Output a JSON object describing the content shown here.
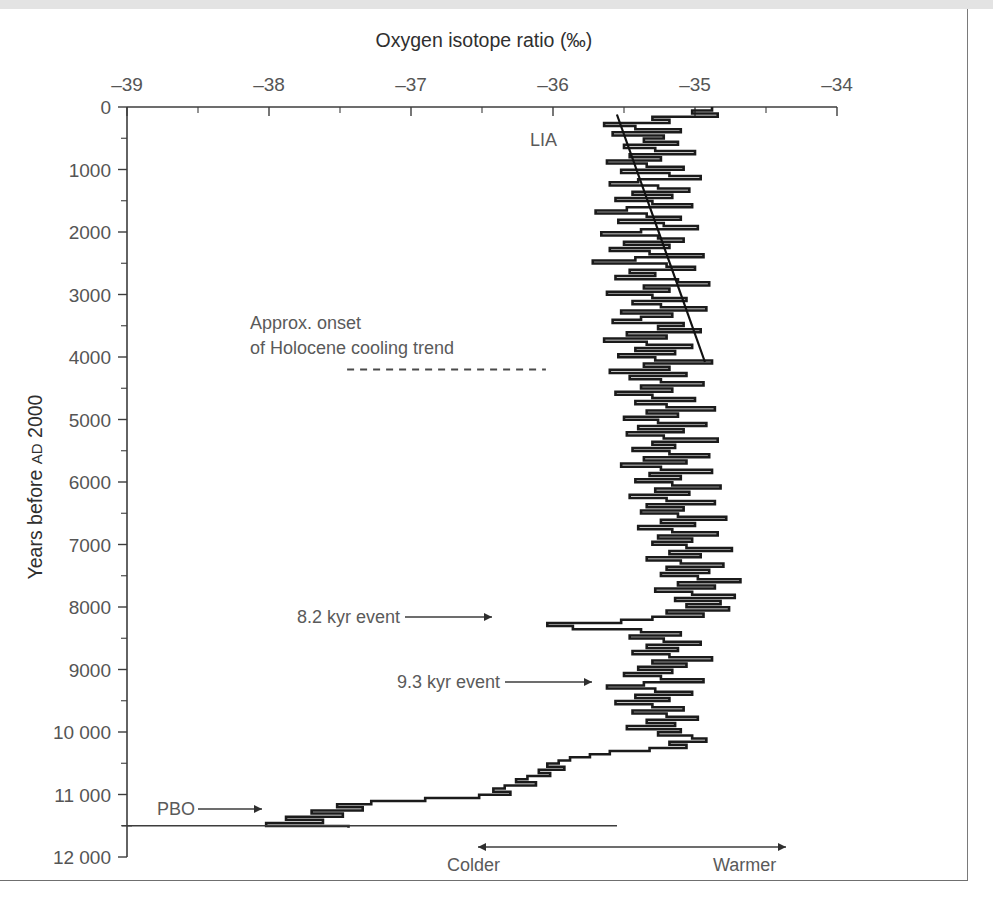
{
  "figure": {
    "top_title": "Oxygen isotope ratio (‰)",
    "y_axis_label_main": "Years before ",
    "y_axis_label_smallcaps": "AD",
    "y_axis_label_tail": " 2000"
  },
  "annotations": [
    {
      "name": "lia",
      "text": "LIA",
      "x": 530,
      "y": 137
    },
    {
      "name": "holocene-onset-line1",
      "text": "Approx. onset",
      "x": 250,
      "y": 320
    },
    {
      "name": "holocene-onset-line2",
      "text": "of Holocene cooling trend",
      "x": 250,
      "y": 345
    },
    {
      "name": "event-8200",
      "text": "8.2 kyr event",
      "x": 297,
      "y": 614
    },
    {
      "name": "event-9300",
      "text": "9.3 kyr event",
      "x": 397,
      "y": 679
    },
    {
      "name": "pbo",
      "text": "PBO",
      "x": 157,
      "y": 806
    },
    {
      "name": "colder",
      "text": "Colder",
      "x": 447,
      "y": 862
    },
    {
      "name": "warmer",
      "text": "Warmer",
      "x": 713,
      "y": 862
    }
  ],
  "chart_data": {
    "type": "line",
    "orientation": "vertical-depth-profile",
    "title": "Oxygen isotope ratio (‰)",
    "xlabel": "Oxygen isotope ratio (‰)",
    "ylabel": "Years before AD 2000",
    "xlim": [
      -39,
      -34
    ],
    "ylim": [
      0,
      12000
    ],
    "x_ticks": [
      -39,
      -38,
      -37,
      -36,
      -35,
      -34
    ],
    "x_tick_labels": [
      "–39",
      "–38",
      "–37",
      "–36",
      "–35",
      "–34"
    ],
    "x_minor_step": 0.5,
    "y_ticks": [
      0,
      1000,
      2000,
      3000,
      4000,
      5000,
      6000,
      7000,
      8000,
      9000,
      10000,
      11000,
      12000
    ],
    "y_tick_labels": [
      "0",
      "1000",
      "2000",
      "3000",
      "4000",
      "5000",
      "6000",
      "7000",
      "8000",
      "9000",
      "10 000",
      "11 000",
      "12 000"
    ],
    "y_minor_step": 500,
    "y_inverted": true,
    "grid": false,
    "legend": null,
    "series_name": "δ18O ice-core record (step plot)",
    "step_style": "horizontal-segment-per-sample",
    "direction_scale": {
      "left": "Colder",
      "right": "Warmer"
    },
    "trend_line": {
      "name": "Holocene cooling trend (late)",
      "x_start": -35.55,
      "y_start": 120,
      "x_end": -34.93,
      "y_end": 4080
    },
    "dashed_marker": {
      "name": "Approx. onset of Holocene cooling trend",
      "age": 4200,
      "x_from": -37.45,
      "x_to": -36.05
    },
    "events": [
      {
        "name": "LIA",
        "age": 350
      },
      {
        "name": "8.2 kyr event",
        "age": 8200
      },
      {
        "name": "9.3 kyr event",
        "age": 9300
      },
      {
        "name": "PBO",
        "age": 11300
      }
    ],
    "ages": [
      30,
      80,
      130,
      180,
      230,
      280,
      330,
      380,
      430,
      480,
      530,
      580,
      630,
      680,
      730,
      780,
      830,
      880,
      930,
      980,
      1030,
      1080,
      1130,
      1180,
      1230,
      1280,
      1330,
      1380,
      1430,
      1480,
      1530,
      1580,
      1630,
      1680,
      1730,
      1780,
      1830,
      1880,
      1930,
      1980,
      2030,
      2080,
      2130,
      2180,
      2230,
      2280,
      2330,
      2380,
      2430,
      2480,
      2530,
      2580,
      2630,
      2680,
      2730,
      2780,
      2830,
      2880,
      2930,
      2980,
      3030,
      3080,
      3130,
      3180,
      3230,
      3280,
      3330,
      3380,
      3430,
      3480,
      3530,
      3580,
      3630,
      3680,
      3730,
      3780,
      3830,
      3880,
      3930,
      3980,
      4030,
      4080,
      4130,
      4180,
      4230,
      4280,
      4330,
      4380,
      4430,
      4480,
      4530,
      4580,
      4630,
      4680,
      4730,
      4780,
      4830,
      4880,
      4930,
      4980,
      5030,
      5080,
      5130,
      5180,
      5230,
      5280,
      5330,
      5380,
      5430,
      5480,
      5530,
      5580,
      5630,
      5680,
      5730,
      5780,
      5830,
      5880,
      5930,
      5980,
      6030,
      6080,
      6130,
      6180,
      6230,
      6280,
      6330,
      6380,
      6430,
      6480,
      6530,
      6580,
      6630,
      6680,
      6730,
      6780,
      6830,
      6880,
      6930,
      6980,
      7030,
      7080,
      7130,
      7180,
      7230,
      7280,
      7330,
      7380,
      7430,
      7480,
      7530,
      7580,
      7630,
      7680,
      7730,
      7780,
      7830,
      7880,
      7930,
      7980,
      8030,
      8080,
      8130,
      8180,
      8230,
      8280,
      8330,
      8380,
      8430,
      8480,
      8530,
      8580,
      8630,
      8680,
      8730,
      8780,
      8830,
      8880,
      8930,
      8980,
      9030,
      9080,
      9130,
      9180,
      9230,
      9280,
      9330,
      9380,
      9430,
      9480,
      9530,
      9580,
      9630,
      9680,
      9730,
      9780,
      9830,
      9880,
      9930,
      9980,
      10030,
      10080,
      10130,
      10180,
      10230,
      10280,
      10330,
      10380,
      10430,
      10480,
      10530,
      10580,
      10630,
      10680,
      10730,
      10780,
      10830,
      10880,
      10930,
      10980,
      11030,
      11080,
      11130,
      11180,
      11230,
      11280,
      11330,
      11380,
      11430,
      11480,
      11530
    ],
    "values": [
      -34.88,
      -35.02,
      -34.84,
      -35.3,
      -35.18,
      -35.64,
      -35.42,
      -35.1,
      -35.58,
      -35.22,
      -35.36,
      -35.12,
      -35.5,
      -35.28,
      -35.0,
      -35.46,
      -35.24,
      -35.62,
      -35.34,
      -35.08,
      -35.52,
      -35.18,
      -34.96,
      -35.4,
      -35.6,
      -35.26,
      -35.04,
      -35.44,
      -35.16,
      -35.56,
      -35.3,
      -35.02,
      -35.48,
      -35.7,
      -35.34,
      -35.1,
      -35.54,
      -35.22,
      -34.98,
      -35.38,
      -35.66,
      -35.26,
      -35.08,
      -35.5,
      -35.18,
      -35.6,
      -35.32,
      -34.94,
      -35.42,
      -35.72,
      -35.2,
      -35.0,
      -35.46,
      -35.28,
      -35.56,
      -35.12,
      -34.9,
      -35.36,
      -35.18,
      -35.62,
      -35.3,
      -35.06,
      -35.44,
      -35.24,
      -34.92,
      -35.52,
      -35.16,
      -35.38,
      -35.58,
      -35.08,
      -35.26,
      -34.96,
      -35.48,
      -35.2,
      -35.64,
      -35.34,
      -35.02,
      -35.42,
      -35.14,
      -35.54,
      -35.28,
      -34.88,
      -35.36,
      -35.18,
      -35.6,
      -35.06,
      -35.46,
      -35.24,
      -34.94,
      -35.38,
      -35.16,
      -35.56,
      -35.3,
      -35.0,
      -35.42,
      -35.2,
      -34.86,
      -35.34,
      -35.12,
      -35.5,
      -35.26,
      -34.92,
      -35.4,
      -35.08,
      -35.48,
      -35.22,
      -34.84,
      -35.3,
      -35.14,
      -35.44,
      -35.18,
      -34.9,
      -35.36,
      -35.06,
      -35.52,
      -35.24,
      -34.88,
      -35.32,
      -35.1,
      -35.42,
      -35.16,
      -34.82,
      -35.28,
      -35.04,
      -35.46,
      -35.2,
      -34.86,
      -35.34,
      -35.08,
      -35.38,
      -35.12,
      -34.78,
      -35.24,
      -35.0,
      -35.4,
      -35.16,
      -34.84,
      -35.26,
      -35.02,
      -35.3,
      -35.06,
      -34.74,
      -35.18,
      -34.96,
      -35.34,
      -35.1,
      -34.8,
      -35.2,
      -34.9,
      -35.24,
      -34.98,
      -34.68,
      -35.12,
      -34.86,
      -35.28,
      -35.02,
      -34.72,
      -35.14,
      -34.82,
      -35.06,
      -34.76,
      -35.2,
      -34.94,
      -35.3,
      -35.52,
      -36.04,
      -35.86,
      -35.38,
      -35.1,
      -35.46,
      -35.22,
      -34.96,
      -35.34,
      -35.12,
      -35.44,
      -35.18,
      -34.88,
      -35.3,
      -35.06,
      -35.4,
      -35.16,
      -35.5,
      -35.24,
      -34.94,
      -35.36,
      -35.62,
      -35.28,
      -35.02,
      -35.42,
      -35.18,
      -35.56,
      -35.3,
      -35.08,
      -35.44,
      -35.2,
      -34.98,
      -35.34,
      -35.14,
      -35.48,
      -35.1,
      -35.26,
      -35.02,
      -34.92,
      -35.18,
      -35.06,
      -35.32,
      -35.6,
      -35.74,
      -35.88,
      -35.96,
      -36.04,
      -35.92,
      -36.1,
      -36.02,
      -36.18,
      -36.26,
      -36.12,
      -36.34,
      -36.42,
      -36.3,
      -36.52,
      -36.9,
      -37.28,
      -37.52,
      -37.34,
      -37.7,
      -37.48,
      -37.88,
      -37.62,
      -38.02,
      -37.44
    ]
  }
}
